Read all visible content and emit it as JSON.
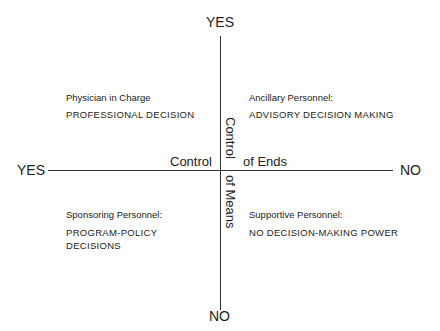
{
  "diagram": {
    "vertical_axis": {
      "top_label": "YES",
      "bottom_label": "NO",
      "title_upper": "Control",
      "title_lower": "of Means"
    },
    "horizontal_axis": {
      "left_label": "YES",
      "right_label": "NO",
      "title_left": "Control",
      "title_right": "of Ends"
    },
    "quadrants": {
      "top_left": {
        "role": "Physician in Charge",
        "decision": "PROFESSIONAL DECISION"
      },
      "top_right": {
        "role": "Ancillary Personnel:",
        "decision": "ADVISORY DECISION MAKING"
      },
      "bottom_left": {
        "role": "Sponsoring Personnel:",
        "decision_line1": "PROGRAM-POLICY",
        "decision_line2": "DECISIONS"
      },
      "bottom_right": {
        "role": "Supportive Personnel:",
        "decision": "NO DECISION-MAKING POWER"
      }
    }
  }
}
